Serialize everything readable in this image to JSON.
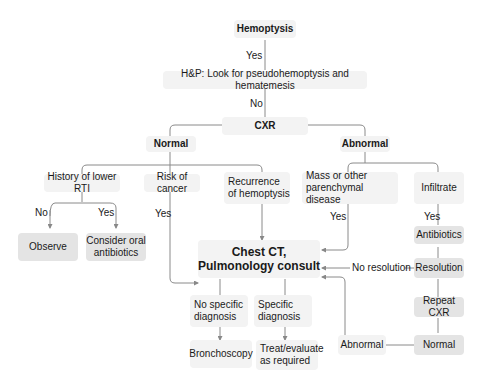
{
  "nodes": {
    "hemoptysis": "Hemoptysis",
    "hp": "H&P: Look for pseudohemoptysis and hematemesis",
    "cxr": "CXR",
    "normal": "Normal",
    "abnormal": "Abnormal",
    "history_rti": "History of lower RTI",
    "risk_cancer": "Risk of cancer",
    "recurrence": "Recurrence of hemoptysis",
    "mass": "Mass or other parenchymal disease",
    "infiltrate": "Infiltrate",
    "observe": "Observe",
    "oral_antibiotics": "Consider oral antibiotics",
    "antibiotics": "Antibiotics",
    "chest_ct_1": "Chest CT,",
    "chest_ct_2": "Pulmonology consult",
    "resolution": "Resolution",
    "no_resolution": "No resolution",
    "repeat_cxr": "Repeat CXR",
    "normal2": "Normal",
    "abnormal2": "Abnormal",
    "no_specific": "No specific diagnosis",
    "specific": "Specific diagnosis",
    "bronchoscopy": "Bronchoscopy",
    "treat": "Treat/evaluate as required"
  },
  "edge_labels": {
    "yes1": "Yes",
    "no1": "No",
    "no2": "No",
    "yes2": "Yes",
    "yes3": "Yes",
    "yes4": "Yes",
    "yes5": "Yes"
  }
}
